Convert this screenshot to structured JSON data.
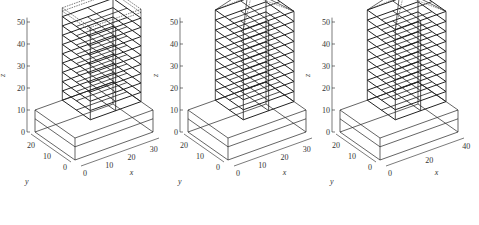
{
  "figure": {
    "panels": 3,
    "line_color": "#222222",
    "background": "#ffffff"
  },
  "chart_data": [
    {
      "type": "3d-wireframe",
      "title": "",
      "xlabel": "x",
      "ylabel": "y",
      "zlabel": "z",
      "x_ticks": [
        "0",
        "10",
        "20",
        "30"
      ],
      "y_ticks": [
        "0",
        "10",
        "20"
      ],
      "z_ticks": [
        "0",
        "10",
        "20",
        "30",
        "40",
        "50"
      ],
      "xlim": [
        0,
        35
      ],
      "ylim": [
        0,
        25
      ],
      "zlim": [
        0,
        52
      ],
      "structure": {
        "podium_height": 10,
        "tower_floors": 9,
        "tower_top": 52,
        "roof": "flat-dashed"
      }
    },
    {
      "type": "3d-wireframe",
      "title": "",
      "xlabel": "x",
      "ylabel": "y",
      "zlabel": "z",
      "x_ticks": [
        "0",
        "10",
        "20",
        "30"
      ],
      "y_ticks": [
        "0",
        "10",
        "20"
      ],
      "z_ticks": [
        "0",
        "10",
        "20",
        "30",
        "40",
        "50"
      ],
      "xlim": [
        0,
        35
      ],
      "ylim": [
        0,
        25
      ],
      "zlim": [
        0,
        55
      ],
      "structure": {
        "podium_height": 10,
        "tower_floors": 9,
        "tower_top": 55,
        "roof": "deformed-peak"
      }
    },
    {
      "type": "3d-wireframe",
      "title": "",
      "xlabel": "x",
      "ylabel": "y",
      "zlabel": "z",
      "x_ticks": [
        "0",
        "20",
        "40"
      ],
      "y_ticks": [
        "0",
        "10",
        "20"
      ],
      "z_ticks": [
        "0",
        "10",
        "20",
        "30",
        "40",
        "50"
      ],
      "xlim": [
        0,
        42
      ],
      "ylim": [
        0,
        25
      ],
      "zlim": [
        0,
        55
      ],
      "structure": {
        "podium_height": 10,
        "tower_floors": 9,
        "tower_top": 55,
        "roof": "deformed-peak"
      }
    }
  ]
}
